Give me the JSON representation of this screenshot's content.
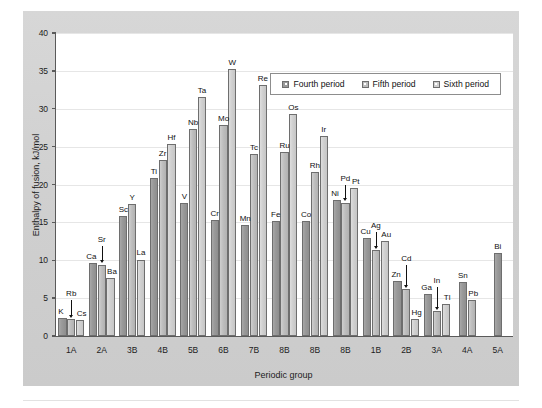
{
  "chart_data": {
    "type": "bar",
    "title": "",
    "xlabel": "Periodic group",
    "ylabel": "Enthalpy of fusion, kJ/mol",
    "ylim": [
      0,
      40
    ],
    "yticks": [
      0,
      5,
      10,
      15,
      20,
      25,
      30,
      35,
      40
    ],
    "grid": true,
    "legend_position": "top-right",
    "categories": [
      "1A",
      "2A",
      "3B",
      "4B",
      "5B",
      "6B",
      "7B",
      "8B",
      "8B",
      "8B",
      "1B",
      "2B",
      "3A",
      "4A",
      "5A"
    ],
    "series": [
      {
        "name": "Fourth period",
        "color": "#9a9a9a",
        "elements": [
          "K",
          "Ca",
          "Sc",
          "Ti",
          "V",
          "Cr",
          "Mn",
          "Fe",
          "Co",
          "Ni",
          "Cu",
          "Zn",
          "Ga",
          "Sn",
          "Bi"
        ],
        "values": [
          2.4,
          9.6,
          15.8,
          20.9,
          17.6,
          15.3,
          14.6,
          15.2,
          15.2,
          17.9,
          13.0,
          7.3,
          5.6,
          7.1,
          11.0
        ]
      },
      {
        "name": "Fifth period",
        "color": "#bebebe",
        "elements": [
          "Rb",
          "Sr",
          "Y",
          "Zr",
          "Nb",
          "Mo",
          "Tc",
          "Ru",
          "Rh",
          "Pd",
          "Ag",
          "Cd",
          "In",
          "Pb",
          ""
        ],
        "values": [
          2.2,
          9.4,
          17.4,
          23.2,
          27.3,
          27.8,
          24.0,
          24.3,
          21.6,
          17.6,
          11.3,
          6.2,
          3.3,
          4.8,
          null
        ]
      },
      {
        "name": "Sixth period",
        "color": "#d0d0d0",
        "elements": [
          "Cs",
          "Ba",
          "La",
          "Hf",
          "Ta",
          "W",
          "Re",
          "Os",
          "Ir",
          "Pt",
          "Au",
          "Hg",
          "Tl",
          "",
          ""
        ],
        "values": [
          2.1,
          7.7,
          10.1,
          25.4,
          31.5,
          35.2,
          33.1,
          29.3,
          26.4,
          19.6,
          12.5,
          2.3,
          4.2,
          null,
          null
        ]
      }
    ],
    "bars": [
      {
        "group": "1A",
        "series": "Fourth period",
        "element": "K",
        "value": 2.4
      },
      {
        "group": "1A",
        "series": "Fifth period",
        "element": "Rb",
        "value": 2.2
      },
      {
        "group": "1A",
        "series": "Sixth period",
        "element": "Cs",
        "value": 2.1
      },
      {
        "group": "2A",
        "series": "Fourth period",
        "element": "Ca",
        "value": 9.6
      },
      {
        "group": "2A",
        "series": "Fifth period",
        "element": "Sr",
        "value": 9.4
      },
      {
        "group": "2A",
        "series": "Sixth period",
        "element": "Ba",
        "value": 7.7
      },
      {
        "group": "3B",
        "series": "Fourth period",
        "element": "Sc",
        "value": 15.8
      },
      {
        "group": "3B",
        "series": "Fifth period",
        "element": "Y",
        "value": 17.4
      },
      {
        "group": "3B",
        "series": "Sixth period",
        "element": "La",
        "value": 10.1
      },
      {
        "group": "4B",
        "series": "Fourth period",
        "element": "Ti",
        "value": 20.9
      },
      {
        "group": "4B",
        "series": "Fifth period",
        "element": "Zr",
        "value": 23.2
      },
      {
        "group": "4B",
        "series": "Sixth period",
        "element": "Hf",
        "value": 25.4
      },
      {
        "group": "5B",
        "series": "Fourth period",
        "element": "V",
        "value": 17.6
      },
      {
        "group": "5B",
        "series": "Fifth period",
        "element": "Nb",
        "value": 27.3
      },
      {
        "group": "5B",
        "series": "Sixth period",
        "element": "Ta",
        "value": 31.5
      },
      {
        "group": "6B",
        "series": "Fourth period",
        "element": "Cr",
        "value": 15.3
      },
      {
        "group": "6B",
        "series": "Fifth period",
        "element": "Mo",
        "value": 27.8
      },
      {
        "group": "6B",
        "series": "Sixth period",
        "element": "W",
        "value": 35.2
      },
      {
        "group": "7B",
        "series": "Fourth period",
        "element": "Mn",
        "value": 14.6
      },
      {
        "group": "7B",
        "series": "Fifth period",
        "element": "Tc",
        "value": 24.0
      },
      {
        "group": "7B",
        "series": "Sixth period",
        "element": "Re",
        "value": 33.1
      },
      {
        "group": "8B",
        "series": "Fourth period",
        "element": "Fe",
        "value": 15.2
      },
      {
        "group": "8B",
        "series": "Fifth period",
        "element": "Ru",
        "value": 24.3
      },
      {
        "group": "8B",
        "series": "Sixth period",
        "element": "Os",
        "value": 29.3
      },
      {
        "group": "8B",
        "series": "Fourth period",
        "element": "Co",
        "value": 15.2
      },
      {
        "group": "8B",
        "series": "Fifth period",
        "element": "Rh",
        "value": 21.6
      },
      {
        "group": "8B",
        "series": "Sixth period",
        "element": "Ir",
        "value": 26.4
      },
      {
        "group": "8B",
        "series": "Fourth period",
        "element": "Ni",
        "value": 17.9
      },
      {
        "group": "8B",
        "series": "Fifth period",
        "element": "Pd",
        "value": 17.6
      },
      {
        "group": "8B",
        "series": "Sixth period",
        "element": "Pt",
        "value": 19.6
      },
      {
        "group": "1B",
        "series": "Fourth period",
        "element": "Cu",
        "value": 13.0
      },
      {
        "group": "1B",
        "series": "Fifth period",
        "element": "Ag",
        "value": 11.3
      },
      {
        "group": "1B",
        "series": "Sixth period",
        "element": "Au",
        "value": 12.5
      },
      {
        "group": "2B",
        "series": "Fourth period",
        "element": "Zn",
        "value": 7.3
      },
      {
        "group": "2B",
        "series": "Fifth period",
        "element": "Cd",
        "value": 6.2
      },
      {
        "group": "2B",
        "series": "Sixth period",
        "element": "Hg",
        "value": 2.3
      },
      {
        "group": "3A",
        "series": "Fourth period",
        "element": "Ga",
        "value": 5.6
      },
      {
        "group": "3A",
        "series": "Fifth period",
        "element": "In",
        "value": 3.3
      },
      {
        "group": "3A",
        "series": "Sixth period",
        "element": "Tl",
        "value": 4.2
      },
      {
        "group": "4A",
        "series": "Fourth period",
        "element": "Sn",
        "value": 7.1
      },
      {
        "group": "4A",
        "series": "Fifth period",
        "element": "Pb",
        "value": 4.8
      },
      {
        "group": "5A",
        "series": "Fourth period",
        "element": "Bi",
        "value": 11.0
      }
    ]
  },
  "axis": {
    "ylabel": "Enthalpy of fusion, kJ/mol",
    "xlabel": "Periodic group",
    "ytick_labels": [
      "0",
      "5",
      "10",
      "15",
      "20",
      "25",
      "30",
      "35",
      "40"
    ],
    "xtick_labels": [
      "1A",
      "2A",
      "3B",
      "4B",
      "5B",
      "6B",
      "7B",
      "8B",
      "8B",
      "8B",
      "1B",
      "2B",
      "3A",
      "4A",
      "5A"
    ]
  },
  "legend": {
    "items": [
      {
        "label": "Fourth period",
        "color": "#9a9a9a"
      },
      {
        "label": "Fifth period",
        "color": "#bebebe"
      },
      {
        "label": "Sixth period",
        "color": "#d0d0d0"
      }
    ]
  }
}
